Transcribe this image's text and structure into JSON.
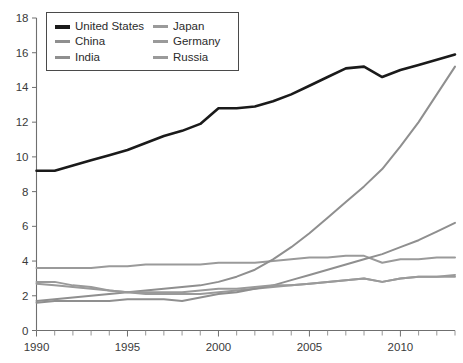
{
  "chart_data": {
    "type": "line",
    "title": "",
    "subtitle": "",
    "xlabel": "",
    "ylabel": "",
    "xlim": [
      1990,
      2013
    ],
    "ylim": [
      0,
      18
    ],
    "grid": false,
    "legend_position": "top-left",
    "x": [
      1990,
      1991,
      1992,
      1993,
      1994,
      1995,
      1996,
      1997,
      1998,
      1999,
      2000,
      2001,
      2002,
      2003,
      2004,
      2005,
      2006,
      2007,
      2008,
      2009,
      2010,
      2011,
      2012,
      2013
    ],
    "xticks_major": [
      1990,
      1995,
      2000,
      2005,
      2010
    ],
    "xtick_labels": [
      "1990",
      "1995",
      "2000",
      "2005",
      "2010"
    ],
    "yticks": [
      0,
      2,
      4,
      6,
      8,
      10,
      12,
      14,
      16,
      18
    ],
    "ytick_labels": [
      "0",
      "2",
      "4",
      "6",
      "8",
      "10",
      "12",
      "14",
      "16",
      "18"
    ],
    "series": [
      {
        "name": "United States",
        "color": "#1a1a1a",
        "width": 2.6,
        "values": [
          9.2,
          9.2,
          9.5,
          9.8,
          10.1,
          10.4,
          10.8,
          11.2,
          11.5,
          11.9,
          12.8,
          12.8,
          12.9,
          13.2,
          13.6,
          14.1,
          14.6,
          15.1,
          15.2,
          14.6,
          15.0,
          15.3,
          15.6,
          15.9
        ]
      },
      {
        "name": "Japan",
        "color": "#9a9a9a",
        "width": 2.0,
        "values": [
          3.6,
          3.6,
          3.6,
          3.6,
          3.7,
          3.7,
          3.8,
          3.8,
          3.8,
          3.8,
          3.9,
          3.9,
          3.9,
          4.0,
          4.1,
          4.2,
          4.2,
          4.3,
          4.3,
          3.9,
          4.1,
          4.1,
          4.2,
          4.2
        ]
      },
      {
        "name": "China",
        "color": "#8f8f8f",
        "width": 2.0,
        "values": [
          1.7,
          1.8,
          1.9,
          2.0,
          2.1,
          2.2,
          2.3,
          2.4,
          2.5,
          2.6,
          2.8,
          3.1,
          3.5,
          4.1,
          4.8,
          5.6,
          6.5,
          7.4,
          8.3,
          9.3,
          10.6,
          12.0,
          13.6,
          15.2
        ]
      },
      {
        "name": "Germany",
        "color": "#9a9a9a",
        "width": 2.0,
        "values": [
          2.7,
          2.6,
          2.5,
          2.4,
          2.3,
          2.2,
          2.1,
          2.1,
          2.1,
          2.1,
          2.2,
          2.3,
          2.4,
          2.5,
          2.6,
          2.7,
          2.8,
          2.9,
          3.0,
          2.8,
          3.0,
          3.1,
          3.1,
          3.2
        ]
      },
      {
        "name": "India",
        "color": "#8f8f8f",
        "width": 2.0,
        "values": [
          1.6,
          1.7,
          1.7,
          1.7,
          1.7,
          1.8,
          1.8,
          1.8,
          1.7,
          1.9,
          2.1,
          2.2,
          2.4,
          2.6,
          2.9,
          3.2,
          3.5,
          3.8,
          4.1,
          4.4,
          4.8,
          5.2,
          5.7,
          6.2
        ]
      },
      {
        "name": "Russia",
        "color": "#9a9a9a",
        "width": 2.0,
        "values": [
          2.8,
          2.8,
          2.6,
          2.5,
          2.3,
          2.2,
          2.2,
          2.2,
          2.2,
          2.3,
          2.4,
          2.4,
          2.5,
          2.6,
          2.6,
          2.7,
          2.8,
          2.9,
          3.0,
          2.8,
          3.0,
          3.1,
          3.1,
          3.1
        ]
      }
    ]
  },
  "legend": {
    "items": [
      {
        "label": "United States",
        "color": "#1a1a1a"
      },
      {
        "label": "Japan",
        "color": "#9a9a9a"
      },
      {
        "label": "China",
        "color": "#8f8f8f"
      },
      {
        "label": "Germany",
        "color": "#9a9a9a"
      },
      {
        "label": "India",
        "color": "#8f8f8f"
      },
      {
        "label": "Russia",
        "color": "#9a9a9a"
      }
    ]
  }
}
